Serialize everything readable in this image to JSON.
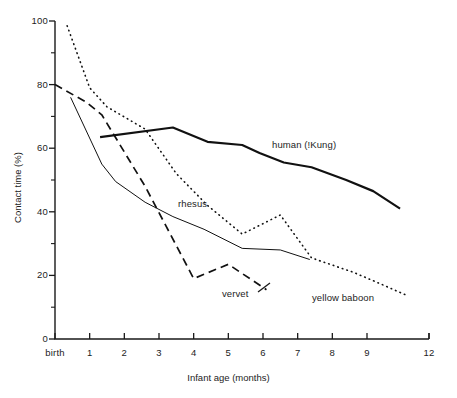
{
  "chart_data": {
    "type": "line",
    "title": "",
    "xlabel": "Infant age (months)",
    "ylabel": "Contact time (%)",
    "xlim": [
      -0.6,
      12
    ],
    "ylim": [
      0,
      100
    ],
    "grid": false,
    "legend": "inline-annotations",
    "x_tick_labels": [
      "birth",
      "1",
      "2",
      "3",
      "4",
      "5",
      "6",
      "7",
      "8",
      "9",
      "12"
    ],
    "x_tick_values": [
      0,
      1,
      2,
      3,
      4,
      5,
      6,
      7,
      8,
      9,
      12
    ],
    "y_tick_labels": [
      "0",
      "20",
      "40",
      "60",
      "80",
      "100"
    ],
    "y_tick_values": [
      0,
      20,
      40,
      60,
      80,
      100
    ],
    "y_minor_ticks": [
      10,
      30,
      50,
      70,
      90
    ],
    "series": [
      {
        "name": "human (!Kung)",
        "style": "solid-thick",
        "color": "#111111",
        "label": "human (!Kung)",
        "x": [
          1.3,
          3.4,
          4.4,
          5.4,
          5.9,
          6.6,
          7.4,
          8.4,
          9.3,
          10.6
        ],
        "y": [
          63.5,
          66.5,
          62.0,
          61.0,
          58.5,
          55.5,
          54.0,
          50.0,
          46.5,
          41.0
        ]
      },
      {
        "name": "rhesus",
        "style": "solid-thin",
        "color": "#111111",
        "label": "rhesus",
        "x": [
          0.45,
          1.35,
          1.75,
          2.6,
          3.4,
          4.3,
          5.4,
          6.5,
          7.35
        ],
        "y": [
          76.0,
          55.0,
          49.5,
          43.0,
          38.5,
          34.5,
          28.5,
          28.0,
          25.0
        ]
      },
      {
        "name": "vervet",
        "style": "dashed",
        "color": "#111111",
        "label": "vervet",
        "x": [
          0.0,
          0.9,
          1.35,
          2.6,
          4.0,
          5.0,
          6.1
        ],
        "y": [
          80.0,
          74.5,
          70.5,
          48.0,
          19.0,
          23.5,
          15.5
        ]
      },
      {
        "name": "yellow baboon",
        "style": "dotted",
        "color": "#111111",
        "label": "yellow baboon",
        "x": [
          0.35,
          1.0,
          1.5,
          2.6,
          3.5,
          4.4,
          5.4,
          6.5,
          7.4,
          8.6,
          9.6,
          11.0
        ],
        "y": [
          98.5,
          79.0,
          73.0,
          66.0,
          52.0,
          42.0,
          33.0,
          39.0,
          25.5,
          21.0,
          17.5,
          13.5
        ]
      }
    ]
  },
  "axis": {
    "y_title": "Contact time (%)",
    "x_title": "Infant age (months)"
  },
  "annotations": {
    "human": "human (!Kung)",
    "rhesus": "rhesus",
    "vervet": "vervet",
    "baboon": "yellow baboon"
  }
}
